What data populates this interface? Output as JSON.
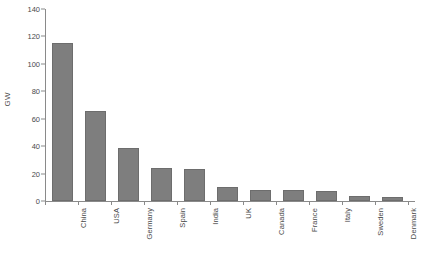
{
  "chart_data": {
    "type": "bar",
    "title": "",
    "subtitle": "",
    "xlabel": "",
    "ylabel": "GW",
    "categories": [
      "China",
      "USA",
      "Germany",
      "Spain",
      "India",
      "UK",
      "Canada",
      "France",
      "Italy",
      "Sweden",
      "Denmark"
    ],
    "values": [
      115,
      66,
      39,
      24,
      23,
      10,
      8,
      8,
      7,
      4,
      3
    ],
    "ylim": [
      0,
      140
    ],
    "ytick_labels": [
      "0",
      "20",
      "40",
      "60",
      "80",
      "100",
      "120",
      "140"
    ],
    "ytick_values": [
      0,
      20,
      40,
      60,
      80,
      100,
      120,
      140
    ],
    "grid": false,
    "legend": null,
    "legend_position": "none",
    "bar_color": "#7e7e7e",
    "bar_edge_color": "#6d6d6d",
    "axis_color": "#8a8a8a",
    "text_color": "#4a4a4a",
    "background_color": "#ffffff",
    "annotations": []
  }
}
